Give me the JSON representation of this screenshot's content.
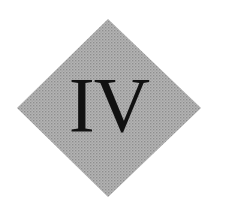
{
  "emblem": {
    "text": "IV",
    "shape": "diamond",
    "fill_color": "#a9a9a9",
    "text_color": "#111111",
    "background_color": "#ffffff"
  }
}
